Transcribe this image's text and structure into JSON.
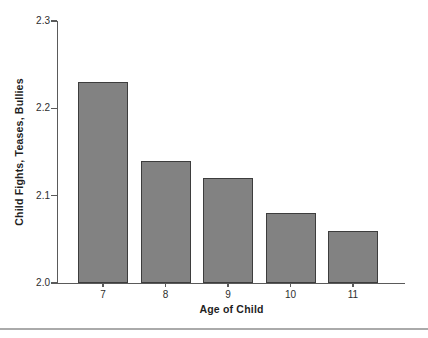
{
  "figure": {
    "background": "#ffffff",
    "bottom_rule_color": "#aaaaaa"
  },
  "chart_data": {
    "type": "bar",
    "categories": [
      "7",
      "8",
      "9",
      "10",
      "11"
    ],
    "values": [
      2.23,
      2.14,
      2.12,
      2.08,
      2.06
    ],
    "title": "",
    "xlabel": "Age of Child",
    "ylabel": "Child Fights, Teases, Bullies",
    "ylim": [
      2.0,
      2.3
    ],
    "yticks": [
      2.0,
      2.1,
      2.2,
      2.3
    ],
    "ytick_labels": [
      "2.0",
      "2.1",
      "2.2",
      "2.3"
    ],
    "grid": false,
    "legend": "none",
    "colors": {
      "bar_fill": "#828282",
      "bar_border": "#3d3d3d",
      "axis": "#5a5a5a",
      "tick_label_text": "#2e2e2e",
      "title_text": "#1f1f1f"
    }
  }
}
